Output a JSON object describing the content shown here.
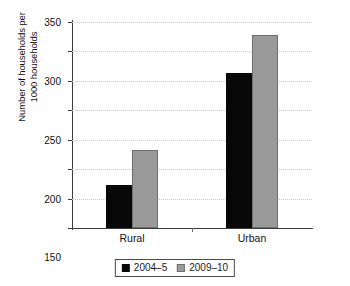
{
  "chart_data": {
    "type": "bar",
    "title": "",
    "xlabel": "",
    "ylabel": "Number of households per\n1000 households",
    "categories": [
      "Rural",
      "Urban"
    ],
    "series": [
      {
        "name": "2004–5",
        "color": "#080808",
        "values": [
          73,
          263
        ]
      },
      {
        "name": "2009–10",
        "color": "#9a9a9a",
        "values": [
          132,
          328
        ]
      }
    ],
    "ylim": [
      0,
      350
    ],
    "yticks": [
      0,
      50,
      100,
      150,
      200,
      250,
      300,
      350
    ],
    "ytick_labels": [
      "0",
      "50",
      "100",
      "150",
      "200",
      "250",
      "300",
      "350"
    ],
    "grid": "horizontal-dotted",
    "legend_position": "bottom-center"
  }
}
